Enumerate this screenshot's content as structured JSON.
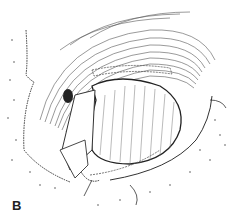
{
  "figure": {
    "panel_label": "B",
    "style": "monochrome line drawing",
    "colors": {
      "ink": "#333333",
      "background": "#ffffff"
    }
  }
}
